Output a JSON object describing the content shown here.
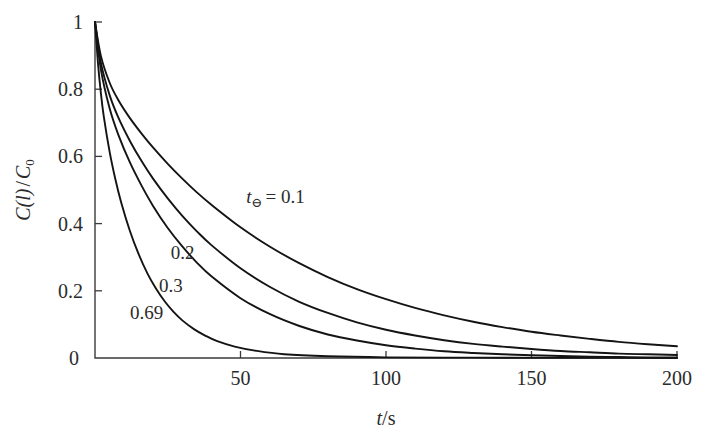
{
  "chart_data": {
    "type": "line",
    "title": "",
    "xlabel": "t/s",
    "ylabel": "C(l)/C0",
    "ylabel_parts": {
      "prefix": "C",
      "arg": "(l)",
      "div": "/",
      "base": "C",
      "sub": "0"
    },
    "xlabel_parts": {
      "sym": "t",
      "div": "/",
      "unit": "s"
    },
    "xlim": [
      0,
      200
    ],
    "ylim": [
      0,
      1
    ],
    "xticks": [
      0,
      50,
      100,
      150,
      200
    ],
    "xtick_labels": [
      "0",
      "50",
      "100",
      "150",
      "200"
    ],
    "yticks": [
      0,
      0.2,
      0.4,
      0.6,
      0.8,
      1
    ],
    "ytick_labels": [
      "0",
      "0.2",
      "0.4",
      "0.6",
      "0.8",
      "1"
    ],
    "grid": false,
    "legend": "inline-curve-labels",
    "series_param_symbol": "t",
    "series_param_subscript": "⊖",
    "series": [
      {
        "name": "t⊖ = 0.1",
        "param": 0.1,
        "label": "0.1",
        "x": [
          0,
          2,
          5,
          8,
          12,
          16,
          20,
          25,
          30,
          35,
          40,
          50,
          60,
          70,
          80,
          90,
          100,
          110,
          120,
          130,
          140,
          150,
          160,
          170,
          180,
          190,
          200
        ],
        "y": [
          1.0,
          0.9,
          0.82,
          0.768,
          0.714,
          0.668,
          0.626,
          0.578,
          0.534,
          0.493,
          0.456,
          0.389,
          0.332,
          0.283,
          0.241,
          0.205,
          0.175,
          0.149,
          0.127,
          0.108,
          0.092,
          0.078,
          0.067,
          0.057,
          0.048,
          0.041,
          0.035
        ]
      },
      {
        "name": "0.2",
        "param": 0.2,
        "label": "0.2",
        "x": [
          0,
          2,
          5,
          8,
          12,
          16,
          20,
          25,
          30,
          35,
          40,
          50,
          60,
          70,
          80,
          90,
          100,
          110,
          120,
          130,
          140,
          150,
          160,
          170,
          180,
          190,
          200
        ],
        "y": [
          1.0,
          0.88,
          0.783,
          0.716,
          0.646,
          0.586,
          0.533,
          0.475,
          0.423,
          0.377,
          0.336,
          0.267,
          0.212,
          0.168,
          0.134,
          0.106,
          0.084,
          0.067,
          0.053,
          0.042,
          0.034,
          0.027,
          0.021,
          0.017,
          0.013,
          0.011,
          0.009
        ]
      },
      {
        "name": "0.3",
        "param": 0.3,
        "label": "0.3",
        "x": [
          0,
          2,
          5,
          8,
          12,
          16,
          20,
          25,
          30,
          35,
          40,
          50,
          60,
          70,
          80,
          90,
          100,
          110,
          120,
          130,
          140,
          150,
          160,
          170,
          180,
          190,
          200
        ],
        "y": [
          1.0,
          0.86,
          0.744,
          0.665,
          0.582,
          0.513,
          0.452,
          0.387,
          0.332,
          0.284,
          0.243,
          0.178,
          0.131,
          0.096,
          0.07,
          0.052,
          0.038,
          0.028,
          0.02,
          0.015,
          0.011,
          0.008,
          0.006,
          0.004,
          0.003,
          0.002,
          0.002
        ]
      },
      {
        "name": "0.69",
        "param": 0.69,
        "label": "0.69",
        "x": [
          0,
          1,
          2,
          3,
          5,
          7,
          9,
          12,
          15,
          18,
          21,
          24,
          27,
          30,
          34,
          38,
          42,
          48,
          55,
          65,
          80,
          100,
          130,
          160,
          200
        ],
        "y": [
          1.0,
          0.88,
          0.79,
          0.72,
          0.615,
          0.532,
          0.463,
          0.378,
          0.309,
          0.252,
          0.206,
          0.168,
          0.137,
          0.112,
          0.086,
          0.066,
          0.05,
          0.034,
          0.022,
          0.011,
          0.005,
          0.002,
          0.001,
          0.0005,
          0.0002
        ]
      }
    ],
    "curve_annotations": [
      {
        "text": "t⊖ = 0.1",
        "x_data": 52,
        "y_data": 0.46
      },
      {
        "text": "0.2",
        "x_data": 26,
        "y_data": 0.295
      },
      {
        "text": "0.3",
        "x_data": 22,
        "y_data": 0.195
      },
      {
        "text": "0.69",
        "x_data": 12,
        "y_data": 0.115
      }
    ]
  },
  "figure": {
    "background_color": "#ffffff",
    "curve_color": "#141414",
    "axis_color": "#3a3a3a",
    "text_color": "#2b2b2b"
  }
}
